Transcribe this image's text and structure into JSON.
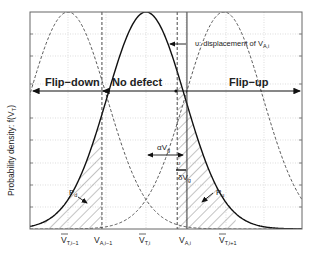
{
  "figure": {
    "ylabel": "Probability density: f(V",
    "ylabel_sub": "T",
    "ylabel_close": ")",
    "regions": {
      "flip_down": "Flip−down",
      "no_defect": "No defect",
      "flip_up": "Flip−up"
    },
    "annotations": {
      "displacement": "υ: displacement of V",
      "displacement_sub": "A,i",
      "alpha_v": "αV",
      "alpha_v_sub": "g",
      "delta_v": "δV",
      "delta_v_sub": "g",
      "upsilon": "υ",
      "p_d": "P",
      "p_d_sub": "d",
      "p_u": "P",
      "p_u_sub": "u"
    },
    "x_labels": [
      {
        "main": "V",
        "sub": "T,i−1",
        "overline": true
      },
      {
        "main": "V",
        "sub": "A,i−1",
        "overline": false
      },
      {
        "main": "V",
        "sub": "T,i",
        "overline": true
      },
      {
        "main": "V",
        "sub": "A,i",
        "overline": false
      },
      {
        "main": "V",
        "sub": "T,i+1",
        "overline": true
      }
    ]
  },
  "chart_data": {
    "type": "line",
    "title": "",
    "xlabel": "",
    "ylabel": "Probability density: f(V_T)",
    "grid": true,
    "series": [
      {
        "name": "f(V_T) centered at V_T,i-1",
        "style": "dashed",
        "mean": 0.0,
        "sigma": 1.0
      },
      {
        "name": "f(V_T) centered at V_T,i",
        "style": "solid",
        "mean": 2.0,
        "sigma": 1.0
      },
      {
        "name": "f(V_T) centered at V_T,i+1",
        "style": "dashed",
        "mean": 4.0,
        "sigma": 1.0
      }
    ],
    "vertical_markers": [
      {
        "name": "V_A,i-1",
        "x": 0.87,
        "style": "dashed"
      },
      {
        "name": "V_A,i nominal",
        "x": 2.8,
        "style": "dashed"
      },
      {
        "name": "V_A,i",
        "x": 3.05,
        "style": "solid"
      }
    ],
    "shaded_regions": [
      {
        "name": "P_d",
        "from": -0.6,
        "to": 0.87,
        "under": "solid"
      },
      {
        "name": "P_u",
        "from": 2.8,
        "to": 4.3,
        "under": "solid"
      }
    ],
    "xlim": [
      -1.0,
      6.0
    ],
    "ylim": [
      0,
      1.0
    ]
  }
}
